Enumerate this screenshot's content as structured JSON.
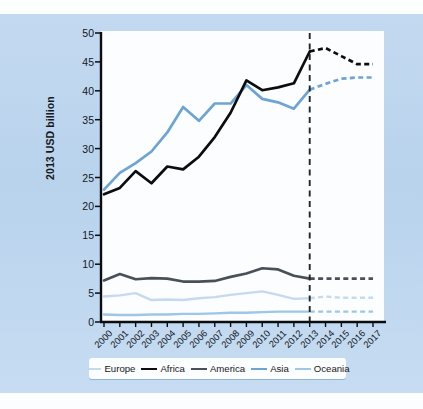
{
  "figure": {
    "background_color": "#bcd5ee",
    "plot_background_color": "#fbfdfe"
  },
  "axis": {
    "ylabel": "2013 USD billion",
    "yticks": [
      "0",
      "5",
      "10",
      "15",
      "20",
      "25",
      "30",
      "35",
      "40",
      "45",
      "50"
    ],
    "xticks": [
      "2000",
      "2001",
      "2002",
      "2003",
      "2004",
      "2005",
      "2006",
      "2007",
      "2008",
      "2009",
      "2010",
      "2011",
      "2012",
      "2013",
      "2014",
      "2015",
      "2016",
      "2017"
    ]
  },
  "legend": {
    "items": [
      {
        "label": "Europe",
        "color": "#c5daee",
        "width": 2.6
      },
      {
        "label": "Africa",
        "color": "#0c0d0f",
        "width": 2.8
      },
      {
        "label": "America",
        "color": "#4a5059",
        "width": 2.8
      },
      {
        "label": "Asia",
        "color": "#6da4d4",
        "width": 2.8
      },
      {
        "label": "Oceania",
        "color": "#9ec6e6",
        "width": 2.6
      }
    ]
  },
  "annotations": {
    "forecast_divider_year": "2013",
    "forecast_divider_color": "#22262b",
    "forecast_note": "Values after 2013 are shown as dashed projections"
  },
  "chart_data": {
    "type": "line",
    "title": "",
    "xlabel": "",
    "ylabel": "2013 USD billion",
    "x": [
      2000,
      2001,
      2002,
      2003,
      2004,
      2005,
      2006,
      2007,
      2008,
      2009,
      2010,
      2011,
      2012,
      2013,
      2014,
      2015,
      2016,
      2017
    ],
    "ylim": [
      0,
      50
    ],
    "xlim": [
      2000,
      2017
    ],
    "grid": false,
    "legend_position": "bottom",
    "forecast_starts_at": 2013,
    "series": [
      {
        "name": "Africa",
        "color": "#0c0d0f",
        "values": [
          22.1,
          23.2,
          26.1,
          24.0,
          26.9,
          26.4,
          28.6,
          32.0,
          36.2,
          41.8,
          40.1,
          40.6,
          41.3,
          46.8,
          47.4,
          46.0,
          44.6,
          44.6
        ]
      },
      {
        "name": "Asia",
        "color": "#6da4d4",
        "values": [
          22.9,
          25.8,
          27.5,
          29.5,
          32.8,
          37.2,
          34.8,
          37.8,
          37.8,
          41.0,
          38.6,
          38.0,
          36.9,
          40.2,
          41.2,
          42.1,
          42.3,
          42.3
        ]
      },
      {
        "name": "America",
        "color": "#4a5059",
        "values": [
          7.2,
          8.3,
          7.4,
          7.6,
          7.5,
          7.0,
          7.0,
          7.1,
          7.8,
          8.4,
          9.3,
          9.1,
          8.0,
          7.5,
          7.5,
          7.5,
          7.5,
          7.5
        ]
      },
      {
        "name": "Europe",
        "color": "#c5daee",
        "values": [
          4.4,
          4.6,
          5.0,
          3.8,
          3.9,
          3.8,
          4.1,
          4.3,
          4.7,
          5.0,
          5.3,
          4.7,
          4.0,
          4.1,
          4.4,
          4.2,
          4.2,
          4.2
        ]
      },
      {
        "name": "Oceania",
        "color": "#9ec6e6",
        "values": [
          1.3,
          1.2,
          1.2,
          1.3,
          1.3,
          1.4,
          1.4,
          1.5,
          1.6,
          1.6,
          1.7,
          1.8,
          1.8,
          1.8,
          1.8,
          1.8,
          1.8,
          1.8
        ]
      }
    ]
  }
}
